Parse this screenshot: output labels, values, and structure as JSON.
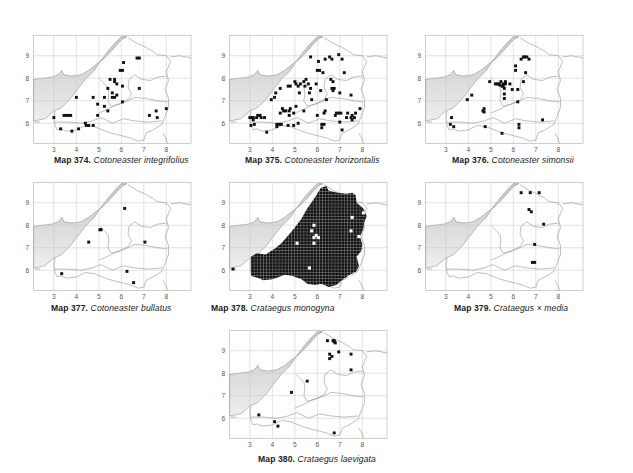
{
  "figure": {
    "type": "distribution-maps",
    "grid": {
      "x_ticks": [
        3,
        4,
        5,
        6,
        7,
        8
      ],
      "y_ticks": [
        6,
        7,
        8,
        9
      ],
      "x_range": [
        2.1,
        9.1
      ],
      "y_range": [
        5.1,
        9.9
      ]
    },
    "colors": {
      "sea_shade": "#c8c8c8",
      "sea_light": "#eeeeee",
      "grid": "#c9c9c9",
      "border": "#8a8a8a",
      "frame": "#bdbdbd",
      "dot": "#111111"
    }
  },
  "maps": [
    {
      "id": "374",
      "label": "Map 374.",
      "species": "Cotoneaster integrifolius",
      "pos": {
        "x": 35,
        "y": 30
      },
      "caption_pos": {
        "x": 54,
        "y": 155
      },
      "records": [
        [
          6.7,
          8.9
        ],
        [
          6.8,
          8.9
        ],
        [
          6.1,
          8.7
        ],
        [
          5.95,
          8.35
        ],
        [
          6.05,
          8.35
        ],
        [
          5.5,
          7.95
        ],
        [
          5.7,
          7.95
        ],
        [
          5.7,
          7.85
        ],
        [
          5.8,
          7.75
        ],
        [
          6.05,
          7.65
        ],
        [
          6.8,
          7.55
        ],
        [
          5.4,
          7.55
        ],
        [
          5.6,
          7.35
        ],
        [
          5.8,
          7.25
        ],
        [
          4.0,
          7.15
        ],
        [
          4.75,
          7.15
        ],
        [
          5.25,
          7.15
        ],
        [
          5.6,
          7.15
        ],
        [
          5.7,
          7.15
        ],
        [
          6.05,
          6.95
        ],
        [
          4.95,
          6.85
        ],
        [
          5.25,
          6.75
        ],
        [
          5.4,
          6.55
        ],
        [
          8.0,
          6.65
        ],
        [
          7.55,
          6.55
        ],
        [
          7.25,
          6.35
        ],
        [
          7.6,
          6.25
        ],
        [
          4.95,
          6.35
        ],
        [
          3.0,
          6.25
        ],
        [
          3.45,
          6.35
        ],
        [
          3.55,
          6.35
        ],
        [
          3.65,
          6.35
        ],
        [
          3.75,
          6.35
        ],
        [
          4.4,
          6.0
        ],
        [
          4.45,
          5.9
        ],
        [
          4.55,
          5.9
        ],
        [
          4.75,
          5.9
        ],
        [
          3.3,
          5.75
        ],
        [
          3.8,
          5.65
        ],
        [
          4.1,
          5.75
        ]
      ]
    },
    {
      "id": "375",
      "label": "Map 375.",
      "species": "Cotoneaster horizontalis",
      "pos": {
        "x": 231,
        "y": 30
      },
      "caption_pos": {
        "x": 245,
        "y": 155
      },
      "records": [
        [
          5.7,
          8.95
        ],
        [
          6.05,
          8.75
        ],
        [
          6.35,
          8.85
        ],
        [
          6.55,
          8.95
        ],
        [
          6.65,
          8.85
        ],
        [
          6.95,
          9.05
        ],
        [
          7.1,
          8.85
        ],
        [
          6.0,
          8.35
        ],
        [
          6.1,
          8.35
        ],
        [
          6.25,
          8.25
        ],
        [
          7.2,
          8.25
        ],
        [
          5.0,
          7.85
        ],
        [
          5.05,
          7.75
        ],
        [
          5.25,
          7.75
        ],
        [
          5.4,
          7.85
        ],
        [
          5.5,
          7.95
        ],
        [
          5.6,
          7.75
        ],
        [
          4.7,
          7.65
        ],
        [
          4.8,
          7.65
        ],
        [
          5.15,
          7.65
        ],
        [
          5.45,
          7.65
        ],
        [
          5.7,
          7.55
        ],
        [
          5.95,
          7.75
        ],
        [
          6.6,
          7.95
        ],
        [
          6.7,
          7.85
        ],
        [
          6.65,
          7.55
        ],
        [
          6.75,
          7.55
        ],
        [
          6.7,
          7.45
        ],
        [
          4.35,
          7.55
        ],
        [
          4.15,
          7.35
        ],
        [
          5.2,
          7.35
        ],
        [
          5.65,
          7.35
        ],
        [
          6.15,
          7.45
        ],
        [
          7.0,
          7.35
        ],
        [
          7.5,
          7.25
        ],
        [
          3.95,
          7.05
        ],
        [
          4.1,
          7.15
        ],
        [
          5.75,
          7.05
        ],
        [
          6.4,
          7.05
        ],
        [
          5.05,
          6.75
        ],
        [
          4.45,
          6.65
        ],
        [
          4.5,
          6.55
        ],
        [
          4.6,
          6.55
        ],
        [
          4.75,
          6.55
        ],
        [
          4.8,
          6.65
        ],
        [
          5.4,
          6.55
        ],
        [
          4.35,
          6.45
        ],
        [
          4.75,
          6.35
        ],
        [
          4.95,
          6.45
        ],
        [
          6.0,
          6.35
        ],
        [
          6.3,
          6.45
        ],
        [
          6.35,
          6.55
        ],
        [
          6.85,
          6.45
        ],
        [
          6.95,
          6.45
        ],
        [
          7.05,
          6.45
        ],
        [
          6.8,
          6.35
        ],
        [
          7.35,
          6.45
        ],
        [
          7.7,
          6.45
        ],
        [
          7.9,
          6.65
        ],
        [
          7.3,
          6.25
        ],
        [
          7.5,
          6.25
        ],
        [
          7.55,
          6.35
        ],
        [
          7.55,
          6.15
        ],
        [
          7.65,
          6.25
        ],
        [
          7.0,
          6.05
        ],
        [
          6.2,
          5.95
        ],
        [
          6.3,
          5.95
        ],
        [
          3.0,
          6.25
        ],
        [
          3.1,
          6.25
        ],
        [
          3.15,
          6.25
        ],
        [
          3.3,
          6.25
        ],
        [
          3.35,
          6.35
        ],
        [
          3.45,
          6.35
        ],
        [
          3.5,
          6.25
        ],
        [
          3.65,
          6.25
        ],
        [
          3.15,
          6.15
        ],
        [
          3.05,
          5.9
        ],
        [
          3.2,
          5.95
        ],
        [
          4.2,
          5.95
        ],
        [
          4.3,
          5.95
        ],
        [
          4.4,
          5.95
        ],
        [
          4.2,
          5.85
        ],
        [
          4.7,
          5.9
        ],
        [
          4.95,
          5.9
        ],
        [
          5.15,
          6.0
        ],
        [
          6.2,
          5.8
        ],
        [
          7.1,
          5.7
        ],
        [
          3.75,
          5.6
        ]
      ]
    },
    {
      "id": "376",
      "label": "Map 376.",
      "species": "Cotoneaster simonsii",
      "pos": {
        "x": 427,
        "y": 30
      },
      "caption_pos": {
        "x": 452,
        "y": 155
      },
      "records": [
        [
          6.45,
          8.95
        ],
        [
          6.5,
          8.95
        ],
        [
          6.6,
          8.95
        ],
        [
          6.35,
          8.85
        ],
        [
          6.7,
          8.85
        ],
        [
          6.1,
          8.55
        ],
        [
          6.1,
          8.35
        ],
        [
          6.55,
          8.25
        ],
        [
          4.95,
          7.85
        ],
        [
          5.2,
          7.75
        ],
        [
          5.3,
          7.75
        ],
        [
          5.35,
          7.75
        ],
        [
          5.4,
          7.7
        ],
        [
          5.55,
          7.75
        ],
        [
          5.55,
          7.65
        ],
        [
          5.65,
          7.75
        ],
        [
          5.45,
          7.85
        ],
        [
          5.65,
          7.85
        ],
        [
          5.85,
          7.75
        ],
        [
          6.45,
          7.85
        ],
        [
          5.6,
          7.55
        ],
        [
          5.5,
          7.65
        ],
        [
          5.95,
          7.5
        ],
        [
          6.2,
          7.5
        ],
        [
          5.6,
          7.3
        ],
        [
          5.6,
          7.1
        ],
        [
          6.2,
          6.95
        ],
        [
          3.95,
          7.05
        ],
        [
          4.15,
          7.25
        ],
        [
          4.7,
          6.65
        ],
        [
          4.65,
          6.55
        ],
        [
          4.7,
          6.5
        ],
        [
          3.25,
          6.25
        ],
        [
          3.2,
          5.95
        ],
        [
          3.35,
          5.85
        ],
        [
          4.75,
          5.85
        ],
        [
          5.5,
          5.55
        ],
        [
          6.25,
          5.95
        ],
        [
          6.25,
          5.8
        ],
        [
          7.3,
          6.15
        ]
      ]
    },
    {
      "id": "377",
      "label": "Map 377.",
      "species": "Cotoneaster bullatus",
      "pos": {
        "x": 35,
        "y": 177
      },
      "caption_pos": {
        "x": 51,
        "y": 303
      },
      "records": [
        [
          6.15,
          8.75
        ],
        [
          5.05,
          7.8
        ],
        [
          5.1,
          7.8
        ],
        [
          4.55,
          7.25
        ],
        [
          7.05,
          7.25
        ],
        [
          3.35,
          5.85
        ],
        [
          6.25,
          5.95
        ],
        [
          6.55,
          5.45
        ]
      ]
    },
    {
      "id": "378",
      "label": "Map 378.",
      "species": "Crataegus monogyna",
      "pos": {
        "x": 231,
        "y": 177
      },
      "caption_pos": {
        "x": 211,
        "y": 303
      },
      "dense_fill": true,
      "fill_outline": [
        [
          3.05,
          5.75
        ],
        [
          3.05,
          6.6
        ],
        [
          3.3,
          6.75
        ],
        [
          3.7,
          6.7
        ],
        [
          4.1,
          6.95
        ],
        [
          4.4,
          7.2
        ],
        [
          4.75,
          7.6
        ],
        [
          5.0,
          7.9
        ],
        [
          5.3,
          8.3
        ],
        [
          5.55,
          8.75
        ],
        [
          5.9,
          9.25
        ],
        [
          6.15,
          9.65
        ],
        [
          6.4,
          9.75
        ],
        [
          6.5,
          9.55
        ],
        [
          6.9,
          9.45
        ],
        [
          7.3,
          9.4
        ],
        [
          7.55,
          9.45
        ],
        [
          7.7,
          9.35
        ],
        [
          7.75,
          9.0
        ],
        [
          8.05,
          8.75
        ],
        [
          8.2,
          8.4
        ],
        [
          8.1,
          8.15
        ],
        [
          8.05,
          7.85
        ],
        [
          7.9,
          7.5
        ],
        [
          8.0,
          7.15
        ],
        [
          7.95,
          6.85
        ],
        [
          7.75,
          6.6
        ],
        [
          7.85,
          6.2
        ],
        [
          7.75,
          5.95
        ],
        [
          7.45,
          5.8
        ],
        [
          7.15,
          5.6
        ],
        [
          6.85,
          5.35
        ],
        [
          6.5,
          5.25
        ],
        [
          6.2,
          5.4
        ],
        [
          5.9,
          5.35
        ],
        [
          5.55,
          5.4
        ],
        [
          5.3,
          5.6
        ],
        [
          4.85,
          5.75
        ],
        [
          4.55,
          5.8
        ],
        [
          4.3,
          5.7
        ],
        [
          4.0,
          5.6
        ],
        [
          3.6,
          5.55
        ],
        [
          3.4,
          5.65
        ]
      ],
      "gaps": [
        [
          5.85,
          8.0
        ],
        [
          5.75,
          7.75
        ],
        [
          5.95,
          7.55
        ],
        [
          6.05,
          7.45
        ],
        [
          5.85,
          7.45
        ],
        [
          5.1,
          7.2
        ],
        [
          5.85,
          7.2
        ],
        [
          5.65,
          6.1
        ],
        [
          7.5,
          7.75
        ],
        [
          7.55,
          8.35
        ],
        [
          7.85,
          7.5
        ],
        [
          8.05,
          8.55
        ],
        [
          7.45,
          5.7
        ]
      ],
      "records": [
        [
          2.25,
          6.05
        ]
      ]
    },
    {
      "id": "379",
      "label": "Map 379.",
      "species": "Crataegus × media",
      "pos": {
        "x": 427,
        "y": 177
      },
      "caption_pos": {
        "x": 454,
        "y": 303
      },
      "records": [
        [
          6.35,
          9.45
        ],
        [
          6.75,
          9.45
        ],
        [
          7.15,
          9.45
        ],
        [
          6.7,
          8.7
        ],
        [
          6.8,
          8.6
        ],
        [
          7.35,
          8.05
        ],
        [
          6.95,
          7.15
        ],
        [
          6.85,
          6.35
        ],
        [
          6.95,
          6.35
        ]
      ]
    },
    {
      "id": "380",
      "label": "Map 380.",
      "species": "Crataegus laevigata",
      "pos": {
        "x": 231,
        "y": 325
      },
      "caption_pos": {
        "x": 258,
        "y": 454
      },
      "records": [
        [
          6.45,
          9.45
        ],
        [
          6.7,
          9.45
        ],
        [
          6.75,
          9.4
        ],
        [
          6.8,
          9.35
        ],
        [
          6.75,
          9.45
        ],
        [
          6.95,
          8.95
        ],
        [
          6.55,
          8.85
        ],
        [
          6.65,
          8.75
        ],
        [
          6.55,
          8.65
        ],
        [
          7.5,
          8.85
        ],
        [
          7.5,
          8.15
        ],
        [
          5.55,
          7.65
        ],
        [
          4.85,
          7.15
        ],
        [
          3.4,
          6.15
        ],
        [
          4.1,
          5.85
        ],
        [
          4.25,
          5.65
        ],
        [
          6.75,
          5.35
        ]
      ]
    }
  ]
}
